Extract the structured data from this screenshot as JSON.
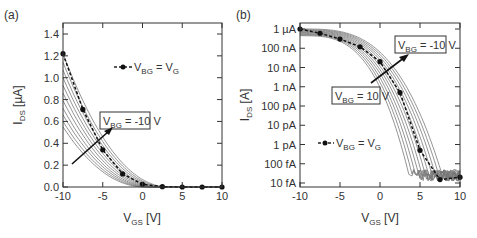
{
  "chart_data": [
    {
      "panel": "(a)",
      "type": "line",
      "xlabel": "V_GS [V]",
      "ylabel": "I_DS [µA]",
      "xlim": [
        -10,
        10
      ],
      "ylim": [
        0,
        1.4
      ],
      "xticks": [
        -10,
        -5,
        0,
        5,
        10
      ],
      "yticks": [
        0.0,
        0.2,
        0.4,
        0.6,
        0.8,
        1.0,
        1.2,
        1.4
      ],
      "ytick_labels": [
        "0.0",
        "0.2",
        "0.4",
        "0.6",
        "0.8",
        "1.0",
        "1.2",
        "1.4"
      ],
      "legend": "V_BG = V_G",
      "annotation": "V_BG = -10 V",
      "grid": false,
      "series": [
        {
          "name": "V_BG = V_G",
          "style": "dashed with dots",
          "x": [
            -10,
            -7.5,
            -5,
            -2.5,
            0,
            2.5,
            5,
            7.5,
            10
          ],
          "y": [
            1.22,
            0.71,
            0.34,
            0.12,
            0.025,
            0.003,
            0.0,
            0.0,
            0.0
          ]
        }
      ],
      "family_curves": {
        "count": 11,
        "description": "Gray curves for V_BG from 10 V to -10 V; I_DS at V_GS=-10 ranges ~0.55 to ~1.22 µA",
        "start_values": [
          0.55,
          0.6,
          0.66,
          0.72,
          0.79,
          0.86,
          0.93,
          1.0,
          1.07,
          1.14,
          1.22
        ],
        "threshold_shift": [
          -3.5,
          -3.0,
          -2.5,
          -2.0,
          -1.5,
          -1.0,
          -0.5,
          0.0,
          0.5,
          1.0,
          1.5
        ]
      }
    },
    {
      "panel": "(b)",
      "type": "line",
      "yscale": "log",
      "xlabel": "V_GS [V]",
      "ylabel": "I_DS [A]",
      "xlim": [
        -10,
        10
      ],
      "ylim": [
        1e-14,
        1e-06
      ],
      "xticks": [
        -10,
        -5,
        0,
        5,
        10
      ],
      "ytick_labels": [
        "1 µA",
        "100 nA",
        "10 nA",
        "1 nA",
        "100 pA",
        "10 pA",
        "1 pA",
        "100 fA",
        "10 fA"
      ],
      "legend": "V_BG = V_G",
      "annotations": [
        "V_BG = -10 V",
        "V_BG = 10 V"
      ],
      "grid": false,
      "series": [
        {
          "name": "V_BG = V_G",
          "style": "dashed with dots",
          "x": [
            -10,
            -7.5,
            -5,
            -2.5,
            0,
            2.5,
            5,
            7.5,
            10
          ],
          "y": [
            1e-06,
            6e-07,
            3e-07,
            1.2e-07,
            2e-08,
            5e-10,
            5e-13,
            1.5e-14,
            2e-14
          ]
        }
      ],
      "family_curves": {
        "count": 11,
        "description": "Gray subthreshold curves shifting right as V_BG goes from 10 V to -10 V; noise floor ~30-100 fA",
        "cutoff_vgs": [
          4.0,
          4.4,
          4.8,
          5.2,
          5.6,
          6.0,
          6.4,
          6.8,
          7.2,
          7.6,
          8.0
        ]
      }
    }
  ],
  "labels": {
    "panel_a": "(a)",
    "panel_b": "(b)",
    "xlabel_main": "V",
    "xlabel_sub": "GS",
    "xlabel_unit": " [V]",
    "ylabel_a_main": "I",
    "ylabel_a_sub": "DS",
    "ylabel_a_unit": " [µA]",
    "ylabel_b_main": "I",
    "ylabel_b_sub": "DS",
    "ylabel_b_unit": " [A]",
    "legend_pre": "V",
    "legend_sub": "BG",
    "legend_mid": " = V",
    "legend_sub2": "G",
    "ann_a_pre": "V",
    "ann_a_sub": "BG",
    "ann_a_post": " = -10 V",
    "ann_b1_pre": "V",
    "ann_b1_sub": "BG",
    "ann_b1_post": " = -10 V",
    "ann_b2_pre": "V",
    "ann_b2_sub": "BG",
    "ann_b2_post": " = 10 V"
  }
}
